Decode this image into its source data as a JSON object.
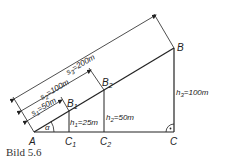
{
  "caption": "Bild 5.6",
  "points": {
    "A": {
      "label": "A"
    },
    "B": {
      "label": "B"
    },
    "C": {
      "label": "C"
    },
    "B1": {
      "label": "B",
      "sub": "1"
    },
    "B2": {
      "label": "B",
      "sub": "2"
    },
    "C1": {
      "label": "C",
      "sub": "1"
    },
    "C2": {
      "label": "C",
      "sub": "2"
    }
  },
  "angle": {
    "label": "α"
  },
  "distances": {
    "s1": {
      "name": "s",
      "sub": "1",
      "value": "=50m"
    },
    "s2": {
      "name": "s",
      "sub": "2",
      "value": "=100m"
    },
    "s3": {
      "name": "s",
      "sub": "3",
      "value": "=200m"
    }
  },
  "heights": {
    "h1": {
      "name": "h",
      "sub": "1",
      "value": "=25m"
    },
    "h2": {
      "name": "h",
      "sub": "2",
      "value": "=50m"
    },
    "h3": {
      "name": "h",
      "sub": "3",
      "value": "=100m"
    }
  },
  "colors": {
    "line": "#222222"
  }
}
